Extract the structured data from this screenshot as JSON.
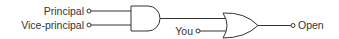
{
  "diagram": {
    "type": "logic-circuit",
    "inputs": [
      {
        "label": "Principal"
      },
      {
        "label": "Vice-principal"
      },
      {
        "label": "You"
      }
    ],
    "gates": [
      {
        "type": "AND",
        "inputs": [
          "Principal",
          "Vice-principal"
        ]
      },
      {
        "type": "OR",
        "inputs": [
          "AND output",
          "You"
        ]
      }
    ],
    "output": {
      "label": "Open"
    },
    "colors": {
      "stroke": "#333333",
      "background": "#ffffff"
    }
  }
}
